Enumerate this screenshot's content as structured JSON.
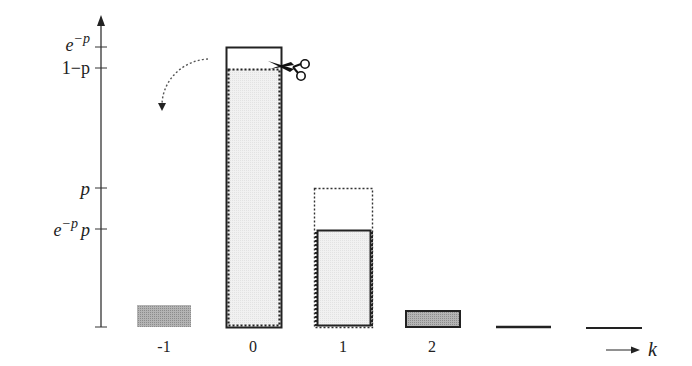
{
  "diagram": {
    "y_axis": {
      "ticks": [
        {
          "label_base": "e",
          "label_sup": "−p",
          "label_tail": "",
          "y": 47
        },
        {
          "label_base": "1−p",
          "label_sup": "",
          "label_tail": "",
          "y": 68
        },
        {
          "label_base": "p",
          "label_sup": "",
          "label_tail": "",
          "y": 188
        },
        {
          "label_base": "e",
          "label_sup": "−p",
          "label_tail": "p",
          "y": 229
        }
      ]
    },
    "x_axis": {
      "label": "k",
      "categories": [
        "-1",
        "0",
        "1",
        "2"
      ]
    },
    "bars": [
      {
        "k": "-1",
        "style": "gray-filled-no-border",
        "height_label": ""
      },
      {
        "k": "0",
        "style": "solid-outline-e^-p with dotted inner 1-p light fill",
        "height_label": ""
      },
      {
        "k": "1",
        "style": "dotted outline p with solid inner e^-p p light fill",
        "height_label": ""
      },
      {
        "k": "2",
        "style": "gray-filled-bordered",
        "height_label": ""
      },
      {
        "k": "3",
        "style": "flat-line",
        "height_label": ""
      },
      {
        "k": "4",
        "style": "flat-line",
        "height_label": ""
      }
    ],
    "annotations": {
      "scissors_icon": "scissors",
      "curved_arrow": "dotted curved arrow pointing down-left from bar 0 toward bar -1"
    },
    "colors": {
      "axis": "#333333",
      "bar_outline": "#222222",
      "light_fill": "#ececec",
      "gray_fill": "#a6a6a6"
    }
  }
}
